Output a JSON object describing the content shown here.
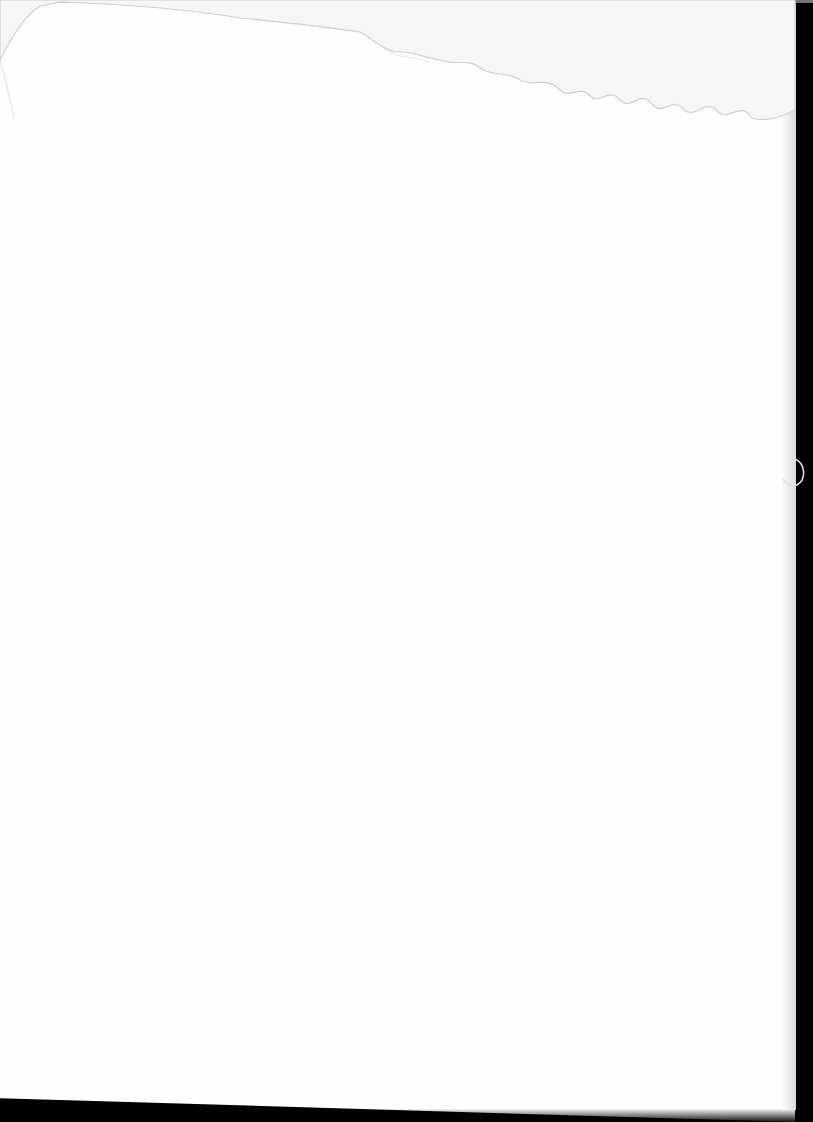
{
  "document": {
    "type": "blank-scanned-page",
    "text": "",
    "visual_features": [
      "water-stain-top",
      "dark-scanner-border-right",
      "paper-curl-right-edge",
      "dark-bottom-edge"
    ],
    "colors": {
      "paper": "#fefefe",
      "background": "#000000",
      "stain": "#c8c8c8"
    }
  }
}
